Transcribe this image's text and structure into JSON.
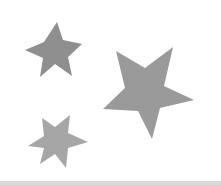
{
  "canvas": {
    "width": 221,
    "height": 185,
    "background": "#ffffff"
  },
  "shapes": [
    {
      "type": "six-pointed-star",
      "color": "#8f8f8f",
      "points": "57,22 63,40 82,44 68,57 72,76 55,64 40,77 43,58 25,50 44,42"
    },
    {
      "type": "five-pointed-star",
      "color": "#9a9a9a",
      "points": "116,51 145,68 173,47 164,86 194,100 160,108 152,139 138,111 103,109 125,88"
    },
    {
      "type": "six-pointed-star",
      "color": "#a6a6a6",
      "points": "42,118 55,127 70,115 68,133 88,142 68,148 66,168 55,154 40,164 44,148 28,146 44,136"
    }
  ],
  "bottom_bar": {
    "color": "#d9d9d9"
  }
}
